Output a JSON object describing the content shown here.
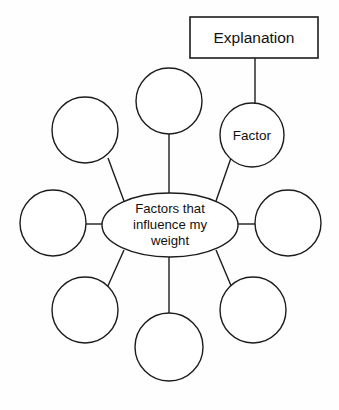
{
  "diagram": {
    "type": "spider-web-concept-map",
    "background_color": "#fefefe",
    "stroke_color": "#1c1c1c",
    "text_color": "#111111",
    "center_node": {
      "label_line_1": "Factors that",
      "label_line_2": "influence my",
      "label_line_3": "weight",
      "shape": "ellipse",
      "cx": 170,
      "cy": 225,
      "rx": 68,
      "ry": 32
    },
    "callout_box": {
      "label": "Explanation",
      "shape": "rectangle",
      "x": 190,
      "y": 17,
      "width": 128,
      "height": 41
    },
    "connector_line": {
      "from_x": 255,
      "from_y": 58,
      "to_x": 255,
      "to_y": 104
    },
    "satellite_nodes": [
      {
        "label": "",
        "name": "node-top",
        "cx": 169,
        "cy": 101,
        "r": 33
      },
      {
        "label": "Factor",
        "name": "node-upper-right",
        "cx": 252,
        "cy": 135,
        "r": 32
      },
      {
        "label": "",
        "name": "node-upper-left",
        "cx": 85,
        "cy": 130,
        "r": 33
      },
      {
        "label": "",
        "name": "node-left",
        "cx": 53,
        "cy": 223,
        "r": 33
      },
      {
        "label": "",
        "name": "node-right",
        "cx": 288,
        "cy": 223,
        "r": 33
      },
      {
        "label": "",
        "name": "node-lower-left",
        "cx": 85,
        "cy": 310,
        "r": 33
      },
      {
        "label": "",
        "name": "node-lower-right",
        "cx": 253,
        "cy": 310,
        "r": 33
      },
      {
        "label": "",
        "name": "node-bottom",
        "cx": 169,
        "cy": 347,
        "r": 34
      }
    ]
  }
}
